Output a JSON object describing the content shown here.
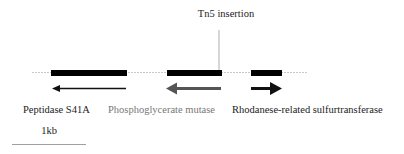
{
  "diagram": {
    "title_annotation": "Tn5 insertion",
    "genes": [
      {
        "label": "Peptidase S41A",
        "strand": "reverse",
        "color": "#111111",
        "label_color": "#222222"
      },
      {
        "label": "Phosphoglycerate mutase",
        "strand": "reverse",
        "color": "#555555",
        "label_color": "#777777"
      },
      {
        "label": "Rhodanese-related sulfurtransferase",
        "strand": "forward",
        "color": "#111111",
        "label_color": "#222222"
      }
    ],
    "scale_bar": {
      "label": "1kb"
    },
    "colors": {
      "gene_box": "#000000",
      "baseline": "#bbbbbb",
      "insertion_line": "#999999"
    }
  }
}
